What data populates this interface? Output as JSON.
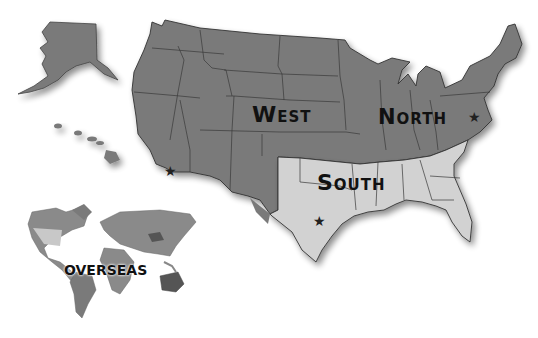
{
  "map": {
    "regions": [
      {
        "id": "west",
        "label": "West",
        "fill": "#7a7a7a"
      },
      {
        "id": "north",
        "label": "North",
        "fill": "#7a7a7a"
      },
      {
        "id": "south",
        "label": "South",
        "fill": "#d2d2d2"
      },
      {
        "id": "overseas",
        "label": "OVERSEAS",
        "fill": "#8a8a8a"
      }
    ],
    "markers": [
      {
        "region": "west",
        "glyph": "★"
      },
      {
        "region": "north",
        "glyph": "★"
      },
      {
        "region": "south",
        "glyph": "★"
      }
    ],
    "colors": {
      "dark_region": "#7a7a7a",
      "light_region": "#d2d2d2",
      "border": "#3a3a3a",
      "shadow": "#bdbdbd",
      "background": "#ffffff"
    }
  }
}
